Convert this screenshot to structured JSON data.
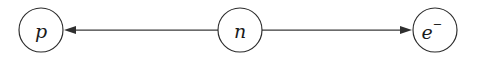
{
  "diagram": {
    "type": "node-edge-diagram",
    "title": "",
    "background_color": "#ffffff",
    "stroke_color": "#2b2b2b",
    "edge_color": "#3a3a3a",
    "label_color": "#1a1a1a",
    "nodes": [
      {
        "id": "proton",
        "label": "p",
        "superscript": "",
        "cx": 41,
        "cy": 30,
        "r": 22
      },
      {
        "id": "neutron",
        "label": "n",
        "superscript": "",
        "cx": 240,
        "cy": 30,
        "r": 22
      },
      {
        "id": "electron",
        "label": "e",
        "superscript": "−",
        "cx": 435,
        "cy": 30,
        "r": 22
      }
    ],
    "edges": [
      {
        "id": "neutron-to-proton",
        "from": "neutron",
        "to": "proton",
        "direction": "left",
        "label": "",
        "x_start": 218,
        "x_end": 64,
        "y": 30
      },
      {
        "id": "neutron-to-electron",
        "from": "neutron",
        "to": "electron",
        "direction": "right",
        "label": "",
        "x_start": 262,
        "x_end": 412,
        "y": 30
      }
    ]
  }
}
